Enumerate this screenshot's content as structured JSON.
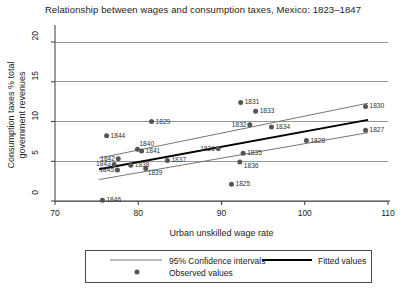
{
  "chart_data": {
    "type": "scatter",
    "title": "Relationship between wages and consumption taxes, Mexico: 1823–1847",
    "xlabel": "Urban unskilled wage rate",
    "ylabel_line1": "Consumption taxes % total",
    "ylabel_line2": "government revenues",
    "xlim": [
      70,
      110
    ],
    "ylim": [
      0,
      20
    ],
    "xticks": [
      "70",
      "80",
      "90",
      "100",
      "110"
    ],
    "xtick_values": [
      70,
      80,
      90,
      100,
      110
    ],
    "yticks": [
      "0",
      "5",
      "10",
      "15",
      "20"
    ],
    "ytick_values": [
      0,
      5,
      10,
      15,
      20
    ],
    "grid": "horizontal",
    "legend_position": "below-axes",
    "series": [
      {
        "name": "Observed values",
        "type": "scatter",
        "marker": "filled-circle",
        "color": "#555555",
        "points": [
          {
            "label": "1825",
            "x": 91.2,
            "y": 2.1
          },
          {
            "label": "1826",
            "x": 89.6,
            "y": 6.6
          },
          {
            "label": "1827",
            "x": 107.3,
            "y": 8.9
          },
          {
            "label": "1828",
            "x": 100.2,
            "y": 7.6
          },
          {
            "label": "1829",
            "x": 81.6,
            "y": 10.0
          },
          {
            "label": "1830",
            "x": 107.3,
            "y": 11.9
          },
          {
            "label": "1831",
            "x": 92.3,
            "y": 12.4
          },
          {
            "label": "1832",
            "x": 93.4,
            "y": 9.6
          },
          {
            "label": "1833",
            "x": 94.1,
            "y": 11.3
          },
          {
            "label": "1834",
            "x": 96.0,
            "y": 9.3
          },
          {
            "label": "1835",
            "x": 92.6,
            "y": 6.0
          },
          {
            "label": "1836",
            "x": 92.2,
            "y": 4.9
          },
          {
            "label": "1837",
            "x": 83.5,
            "y": 5.1
          },
          {
            "label": "1838",
            "x": 79.1,
            "y": 4.5
          },
          {
            "label": "1839",
            "x": 80.9,
            "y": 4.1
          },
          {
            "label": "1840",
            "x": 79.9,
            "y": 6.5
          },
          {
            "label": "1841",
            "x": 80.4,
            "y": 6.3
          },
          {
            "label": "1842",
            "x": 77.6,
            "y": 5.3
          },
          {
            "label": "1843",
            "x": 77.1,
            "y": 4.6
          },
          {
            "label": "1844",
            "x": 76.2,
            "y": 8.2
          },
          {
            "label": "1845",
            "x": 77.5,
            "y": 3.9
          },
          {
            "label": "1846",
            "x": 75.7,
            "y": 0.1
          }
        ]
      },
      {
        "name": "Fitted values",
        "type": "line",
        "color": "#000000",
        "x": [
          75.3,
          107.6
        ],
        "y": [
          4.0,
          10.2
        ]
      },
      {
        "name": "95% Confidence intervals",
        "type": "band",
        "color": "#666666",
        "upper": {
          "x": [
            75.3,
            107.6
          ],
          "y": [
            5.4,
            12.3
          ]
        },
        "lower": {
          "x": [
            75.3,
            107.6
          ],
          "y": [
            2.7,
            8.6
          ]
        }
      }
    ]
  },
  "legend": {
    "ci_label": "95% Confidence intervals",
    "fitted_label": "Fitted values",
    "observed_label": "Observed values"
  }
}
